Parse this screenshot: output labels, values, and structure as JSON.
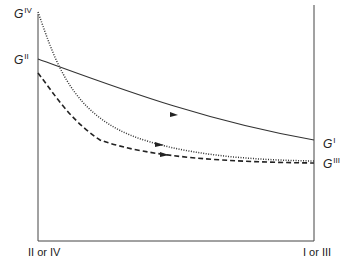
{
  "diagram": {
    "curve_labels": [
      {
        "id": "G_IV",
        "base": "G",
        "sup": "IV"
      },
      {
        "id": "G_II",
        "base": "G",
        "sup": "II"
      },
      {
        "id": "G_I",
        "base": "G",
        "sup": "I"
      },
      {
        "id": "G_III",
        "base": "G",
        "sup": "III"
      }
    ],
    "axis_labels": {
      "left": "II or IV",
      "right": "I or III"
    },
    "curves": [
      {
        "name": "G^I / G^II",
        "style": "solid",
        "from": "G^II",
        "to": "G^I"
      },
      {
        "name": "G^IV",
        "style": "dotted",
        "from": "G^IV",
        "to": "G^III"
      },
      {
        "name": "lower",
        "style": "dashed",
        "to": "G^III"
      }
    ]
  }
}
